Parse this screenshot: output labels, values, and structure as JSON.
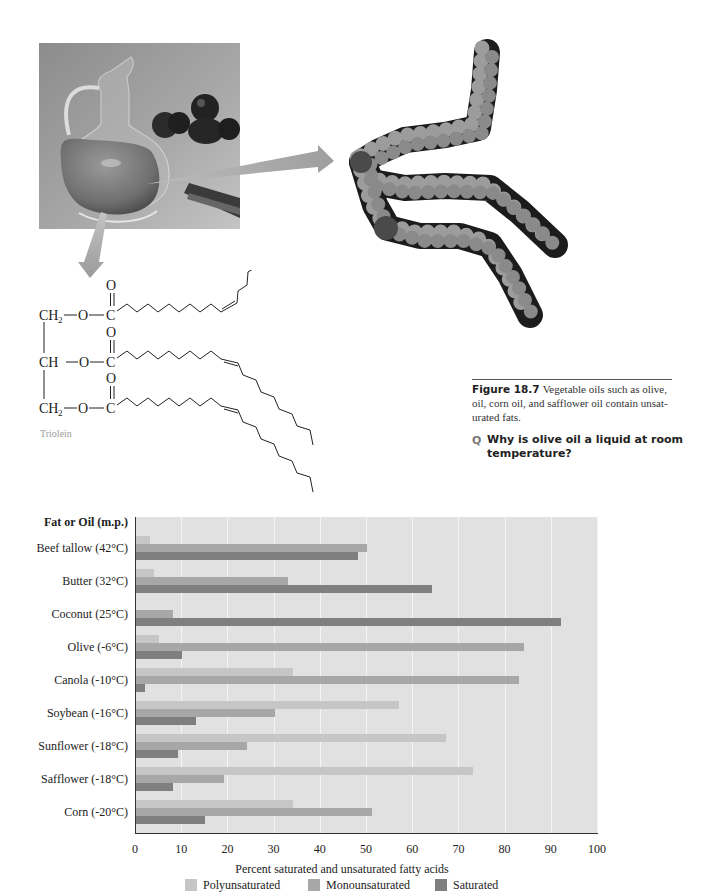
{
  "figure": {
    "label": "Figure 18.7",
    "caption_lines": [
      "Vegetable oils such as olive,",
      "oil, corn oil, and safflower oil contain unsat-",
      "urated fats."
    ],
    "question_marker": "Q",
    "question_lines": [
      "Why is olive oil a liquid at room",
      "temperature?"
    ]
  },
  "photo": {
    "subject": "olive oil cruet with olives"
  },
  "structure": {
    "ch2": "CH",
    "ch": "CH",
    "sub2": "2",
    "oxygen": "O",
    "carbon": "C",
    "name": "Triolein"
  },
  "chart_data": {
    "type": "bar",
    "orientation": "horizontal",
    "title": "",
    "category_header": "Fat or Oil (m.p.)",
    "categories": [
      "Beef tallow (42°C)",
      "Butter (32°C)",
      "Coconut (25°C)",
      "Olive (-6°C)",
      "Canola (-10°C)",
      "Soybean (-16°C)",
      "Sunflower (-18°C)",
      "Safflower (-18°C)",
      "Corn (-20°C)"
    ],
    "series": [
      {
        "name": "Polyunsaturated",
        "color": "#c6c6c6",
        "values": [
          3,
          4,
          0,
          5,
          34,
          57,
          67,
          73,
          34
        ]
      },
      {
        "name": "Monounsaturated",
        "color": "#a7a7a7",
        "values": [
          50,
          33,
          8,
          84,
          83,
          30,
          24,
          19,
          51
        ]
      },
      {
        "name": "Saturated",
        "color": "#7f7f7f",
        "values": [
          48,
          64,
          92,
          10,
          2,
          13,
          9,
          8,
          15
        ]
      }
    ],
    "xlabel": "Percent saturated and unsaturated fatty acids",
    "ylabel": "Fat or Oil (m.p.)",
    "xlim": [
      0,
      100
    ],
    "xticks": [
      "0",
      "10",
      "20",
      "30",
      "40",
      "50",
      "60",
      "70",
      "80",
      "90",
      "100"
    ],
    "grid": true,
    "legend_position": "bottom"
  }
}
